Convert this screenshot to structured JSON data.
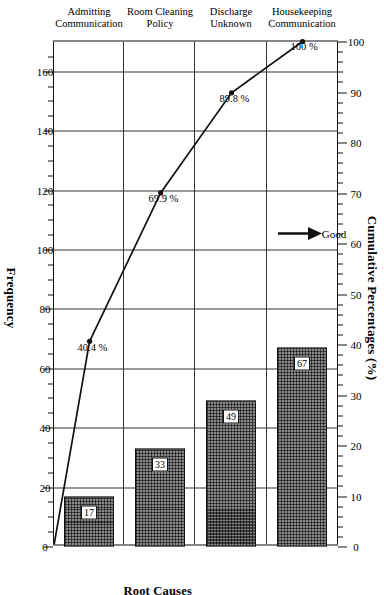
{
  "chart_data": {
    "type": "bar",
    "title": "",
    "categories": [
      "Housekeeping Communication",
      "Discharge Unknown",
      "Room Cleaning Policy",
      "Admitting Communication"
    ],
    "category_lines": [
      [
        "Housekeeping",
        "Communication"
      ],
      [
        "Discharge",
        "Unknown"
      ],
      [
        "Room Cleaning",
        "Policy"
      ],
      [
        "Admitting",
        "Communication"
      ]
    ],
    "values": [
      67,
      49,
      33,
      17
    ],
    "bar_labels": [
      "67",
      "49",
      "33",
      "17"
    ],
    "series": [
      {
        "name": "Frequency",
        "type": "bar",
        "values": [
          67,
          49,
          33,
          17
        ]
      },
      {
        "name": "Cumulative Percentages (%)",
        "type": "line",
        "values": [
          40.4,
          69.9,
          89.8,
          100.0
        ]
      }
    ],
    "cumulative_labels": [
      "40.4 %",
      "69.9 %",
      "89.8 %",
      "100 %"
    ],
    "xlabel": "Root Causes",
    "ylabel": "Frequency",
    "y2label": "Cumulative Percentages (%)",
    "ylim": [
      0,
      170
    ],
    "y2lim": [
      0,
      100
    ],
    "frequency_ticks": [
      0,
      20,
      40,
      60,
      80,
      100,
      120,
      140,
      160
    ],
    "frequency_tick_labels": [
      "0",
      "20",
      "40",
      "60",
      "80",
      "100",
      "120",
      "140",
      "160"
    ],
    "cumulative_ticks": [
      0,
      10,
      20,
      30,
      40,
      50,
      60,
      70,
      80,
      90,
      100
    ],
    "cumulative_tick_labels": [
      "0",
      "10",
      "20",
      "30",
      "40",
      "50",
      "60",
      "70",
      "80",
      "90",
      "100"
    ],
    "grid": true,
    "legend": "none",
    "annotations": [
      {
        "name": "good-direction",
        "text": "Good",
        "arrow": "right"
      }
    ],
    "total": 166,
    "colors": {
      "bar_fill": "#8a8a8a",
      "bar_edge": "#111111",
      "line": "#111111",
      "axis": "#111111",
      "grid": "#333333",
      "background": "#ffffff"
    }
  },
  "axes": {
    "top_title": "Cumulative Percentages (%)",
    "bottom_title": "Frequency",
    "right_title": "Root Causes"
  }
}
